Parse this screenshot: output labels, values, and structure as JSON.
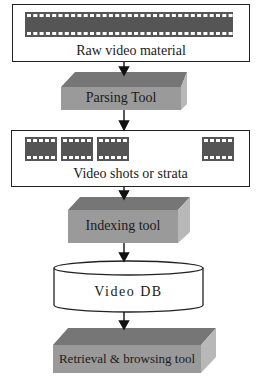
{
  "diagram": {
    "nodes": [
      {
        "id": "raw",
        "label": "Raw video material",
        "shape": "box-with-filmstrip"
      },
      {
        "id": "parsing",
        "label": "Parsing Tool",
        "shape": "3d-block"
      },
      {
        "id": "shots",
        "label": "Video shots or strata",
        "shape": "box-with-film-frames",
        "frame_count": 4
      },
      {
        "id": "indexing",
        "label": "Indexing tool",
        "shape": "3d-block"
      },
      {
        "id": "db",
        "label": "Video DB",
        "shape": "cylinder"
      },
      {
        "id": "retrieval",
        "label": "Retrieval & browsing tool",
        "shape": "3d-block"
      }
    ],
    "edges": [
      {
        "from": "raw",
        "to": "parsing"
      },
      {
        "from": "parsing",
        "to": "shots"
      },
      {
        "from": "shots",
        "to": "indexing"
      },
      {
        "from": "indexing",
        "to": "db"
      },
      {
        "from": "db",
        "to": "retrieval"
      }
    ]
  },
  "labels": {
    "raw": "Raw video material",
    "parsing": "Parsing Tool",
    "shots": "Video shots or strata",
    "indexing": "Indexing tool",
    "db": "Video DB",
    "retrieval": "Retrieval & browsing tool"
  },
  "colors": {
    "block_top": "#767676",
    "block_front": "#9a9a9a",
    "block_side": "#b8b8b8",
    "film": "#555555",
    "line": "#111111"
  }
}
